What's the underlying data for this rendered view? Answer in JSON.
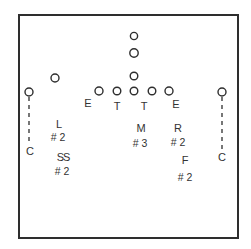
{
  "diagram": {
    "colors": {
      "stroke": "#2e2e2e",
      "text": "#333333",
      "background": "#ffffff"
    },
    "offense": {
      "backfield": [
        {
          "id": "back-deep",
          "x": 134,
          "y": 36,
          "r": 3.6
        },
        {
          "id": "back-mid",
          "x": 134,
          "y": 53,
          "r": 4.2
        },
        {
          "id": "back-qb",
          "x": 134,
          "y": 76,
          "r": 3.8
        }
      ],
      "line": [
        {
          "id": "line-1",
          "x": 99,
          "y": 91,
          "r": 4
        },
        {
          "id": "line-2",
          "x": 117,
          "y": 91,
          "r": 3.8
        },
        {
          "id": "line-center",
          "x": 134,
          "y": 91,
          "r": 3.8
        },
        {
          "id": "line-4",
          "x": 152,
          "y": 91,
          "r": 3.8
        },
        {
          "id": "line-5",
          "x": 169,
          "y": 91,
          "r": 4
        }
      ],
      "flanker": {
        "id": "flanker",
        "x": 55,
        "y": 78,
        "r": 4
      },
      "wide_left": {
        "id": "wide-left",
        "x": 29,
        "y": 92,
        "r": 4
      },
      "wide_right": {
        "id": "wide-right",
        "x": 222,
        "y": 92,
        "r": 4
      }
    },
    "defense": {
      "line_labels": [
        {
          "text": "E",
          "x": 88,
          "y": 103
        },
        {
          "text": "T",
          "x": 117,
          "y": 106
        },
        {
          "text": "T",
          "x": 144,
          "y": 106
        },
        {
          "text": "E",
          "x": 176,
          "y": 104
        }
      ],
      "players": [
        {
          "name": "L",
          "number": "# 2",
          "x": 59,
          "y": 124,
          "nx": 58,
          "ny": 137
        },
        {
          "name": "SS",
          "number": "# 2",
          "x": 63,
          "y": 157,
          "nx": 62,
          "ny": 171
        },
        {
          "name": "M",
          "number": "# 3",
          "x": 141,
          "y": 128,
          "nx": 140,
          "ny": 143
        },
        {
          "name": "R",
          "number": "# 2",
          "x": 178,
          "y": 128,
          "nx": 178,
          "ny": 142
        },
        {
          "name": "F",
          "number": "# 2",
          "x": 185,
          "y": 160,
          "nx": 185,
          "ny": 177
        }
      ],
      "corners": [
        {
          "name": "C",
          "x": 30,
          "y": 151
        },
        {
          "name": "C",
          "x": 222,
          "y": 157
        }
      ]
    }
  }
}
